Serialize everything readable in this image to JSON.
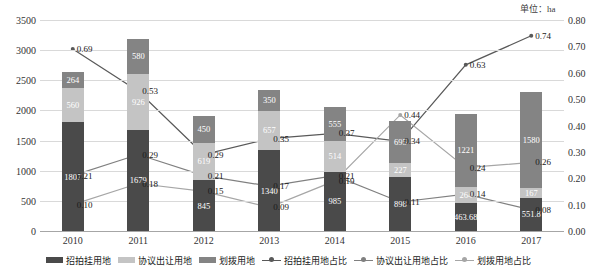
{
  "unit_note": "单位：ha",
  "legend": {
    "items": [
      {
        "label": "招拍挂用地",
        "kind": "bar",
        "color": "#4a4a4a"
      },
      {
        "label": "协议出让用地",
        "kind": "bar",
        "color": "#c4c4c4"
      },
      {
        "label": "划拨用地",
        "kind": "bar",
        "color": "#848484"
      },
      {
        "label": "招拍挂用地占比",
        "kind": "line",
        "color": "#595959"
      },
      {
        "label": "协议出让用地占比",
        "kind": "line",
        "color": "#808080"
      },
      {
        "label": "划拨用地占比",
        "kind": "line",
        "color": "#a6a6a6"
      }
    ]
  },
  "chart_data": {
    "type": "bar",
    "title": "",
    "subtitle": "",
    "xlabel": "",
    "ylabel": "",
    "y2label": "",
    "categories": [
      "2010",
      "2011",
      "2012",
      "2013",
      "2014",
      "2015",
      "2016",
      "2017"
    ],
    "ylim": [
      0,
      3500
    ],
    "y_ticks": [
      "0",
      "500",
      "1000",
      "1500",
      "2000",
      "2500",
      "3000",
      "3500"
    ],
    "y2lim": [
      0,
      0.8
    ],
    "y2_ticks": [
      "0.00",
      "0.10",
      "0.20",
      "0.30",
      "0.40",
      "0.50",
      "0.60",
      "0.70",
      "0.80"
    ],
    "grid": true,
    "legend_position": "bottom",
    "stacked": true,
    "series": [
      {
        "name": "招拍挂用地",
        "kind": "bar",
        "color": "#4a4a4a",
        "values": [
          1807,
          1679,
          845,
          1340,
          985,
          898,
          463.68,
          551.8
        ],
        "labels": [
          "1807",
          "1679",
          "845",
          "1340",
          "985",
          "898",
          "463.68",
          "551.8"
        ]
      },
      {
        "name": "协议出让用地",
        "kind": "bar",
        "color": "#c4c4c4",
        "values": [
          560,
          926,
          619,
          657,
          514,
          227,
          264,
          167
        ],
        "labels": [
          "560",
          "926",
          "619",
          "657",
          "514",
          "227",
          "264",
          "167"
        ]
      },
      {
        "name": "划拨用地",
        "kind": "bar",
        "color": "#848484",
        "values": [
          264,
          580,
          450,
          350,
          555,
          695,
          1221,
          1580
        ],
        "labels": [
          "264",
          "580",
          "450",
          "350",
          "555",
          "695",
          "1221",
          "1580"
        ]
      },
      {
        "name": "招拍挂用地占比",
        "kind": "line",
        "color": "#595959",
        "values": [
          0.69,
          0.53,
          0.29,
          0.35,
          0.37,
          0.34,
          0.63,
          0.74
        ],
        "labels": [
          "0.69",
          "0.53",
          "0.29",
          "0.35",
          "0.37",
          "0.34",
          "0.63",
          "0.74"
        ]
      },
      {
        "name": "协议出让用地占比",
        "kind": "line",
        "color": "#808080",
        "values": [
          0.21,
          0.29,
          0.21,
          0.17,
          0.21,
          0.11,
          0.14,
          0.08
        ],
        "labels": [
          "0.21",
          "0.29",
          "0.21",
          "0.17",
          "0.21",
          "0.11",
          "0.14",
          "0.08"
        ]
      },
      {
        "name": "划拨用地占比",
        "kind": "line",
        "color": "#a6a6a6",
        "values": [
          0.1,
          0.18,
          0.15,
          0.09,
          0.19,
          0.44,
          0.24,
          0.26
        ],
        "labels": [
          "0.10",
          "0.18",
          "0.15",
          "0.09",
          "0.19",
          "0.44",
          "0.24",
          "0.26"
        ]
      }
    ]
  }
}
